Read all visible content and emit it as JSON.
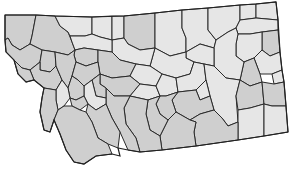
{
  "map": {
    "subject": "Montana counties choropleth",
    "colors": {
      "light": "#e6e6e6",
      "dark": "#cfcfcf",
      "border": "#2a2a2a",
      "background": "#ffffff"
    },
    "legend": null
  }
}
